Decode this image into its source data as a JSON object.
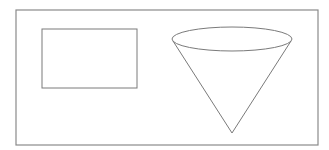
{
  "diagram": {
    "colors": {
      "background": "#ffffff",
      "stroke": "#7a7a7a",
      "frame_stroke": "#8a8a8a"
    },
    "frame": {
      "x": 16,
      "y": 10,
      "width": 302,
      "height": 135
    },
    "shapes": [
      {
        "type": "rectangle",
        "x": 42,
        "y": 29,
        "width": 95,
        "height": 59
      },
      {
        "type": "cone",
        "base_ellipse": {
          "cx": 232,
          "cy": 39,
          "rx": 60,
          "ry": 12
        },
        "apex": {
          "x": 232,
          "y": 133
        }
      }
    ]
  }
}
